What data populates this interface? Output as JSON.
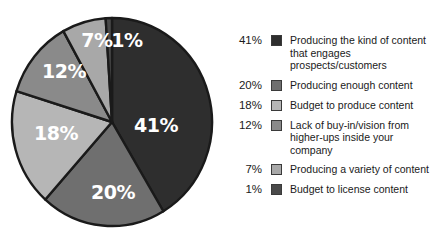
{
  "chart_data": {
    "type": "pie",
    "title": "",
    "legend_position": "right",
    "categories": [
      "Producing the kind of content that engages prospects/customers",
      "Producing enough content",
      "Budget to produce content",
      "Lack of buy-in/vision from higher-ups inside your company",
      "Producing a variety of content",
      "Budget to license content"
    ],
    "values": [
      41,
      20,
      18,
      12,
      7,
      1
    ],
    "value_labels": [
      "41%",
      "20%",
      "18%",
      "12%",
      "7%",
      "1%"
    ],
    "colors": [
      "#2e2e2e",
      "#6f6f6f",
      "#b6b6b6",
      "#8a8a8a",
      "#a8a8a8",
      "#4a4a4a"
    ],
    "start_angle_deg": 0,
    "direction": "clockwise",
    "stroke_color": "#1a1a1a"
  },
  "pie": {
    "outline_color": "#1a1a1a",
    "slices": [
      {
        "label": "41%",
        "value": 41,
        "color": "#2e2e2e",
        "label_x": 146,
        "label_y": 110,
        "size": "normal"
      },
      {
        "label": "20%",
        "value": 20,
        "color": "#6f6f6f",
        "label_x": 103,
        "label_y": 177,
        "size": "normal"
      },
      {
        "label": "18%",
        "value": 18,
        "color": "#b6b6b6",
        "label_x": 46,
        "label_y": 118,
        "size": "normal"
      },
      {
        "label": "12%",
        "value": 12,
        "color": "#8a8a8a",
        "label_x": 54,
        "label_y": 56,
        "size": "normal"
      },
      {
        "label": "7%",
        "value": 7,
        "color": "#a8a8a8",
        "label_x": 87,
        "label_y": 25,
        "size": "normal"
      },
      {
        "label": "1%",
        "value": 1,
        "color": "#4a4a4a",
        "label_x": 117,
        "label_y": 25,
        "size": "normal"
      }
    ]
  },
  "legend": {
    "rows": [
      {
        "pct": "41%",
        "color": "#2e2e2e",
        "text": "Producing the kind of content that engages prospects/customers"
      },
      {
        "pct": "20%",
        "color": "#6f6f6f",
        "text": "Producing enough content"
      },
      {
        "pct": "18%",
        "color": "#b6b6b6",
        "text": "Budget to produce content"
      },
      {
        "pct": "12%",
        "color": "#8a8a8a",
        "text": "Lack of buy-in/vision from higher-ups inside your company"
      },
      {
        "pct": "7%",
        "color": "#a8a8a8",
        "text": "Producing a variety of content"
      },
      {
        "pct": "1%",
        "color": "#4a4a4a",
        "text": "Budget to license content"
      }
    ]
  }
}
